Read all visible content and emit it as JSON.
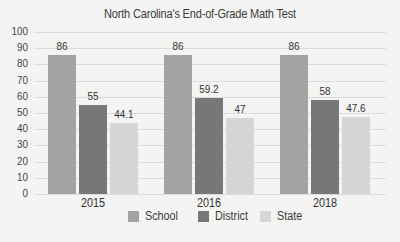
{
  "chart_data": {
    "type": "bar",
    "title": "North Carolina's End-of-Grade Math Test",
    "xlabel": "",
    "ylabel": "",
    "categories": [
      "2015",
      "2016",
      "2018"
    ],
    "series": [
      {
        "name": "School",
        "values": [
          86,
          86,
          86
        ],
        "color": "#a3a3a3"
      },
      {
        "name": "District",
        "values": [
          55,
          59.2,
          58
        ],
        "color": "#777777"
      },
      {
        "name": "State",
        "values": [
          44.1,
          47,
          47.6
        ],
        "color": "#d6d6d6"
      }
    ],
    "value_labels": [
      [
        "86",
        "55",
        "44.1"
      ],
      [
        "86",
        "59.2",
        "47"
      ],
      [
        "86",
        "58",
        "47.6"
      ]
    ],
    "ylim": [
      0,
      100
    ],
    "yticks": [
      "0",
      "10",
      "20",
      "30",
      "40",
      "50",
      "60",
      "70",
      "80",
      "90",
      "100"
    ],
    "grid": true,
    "legend_position": "bottom"
  }
}
